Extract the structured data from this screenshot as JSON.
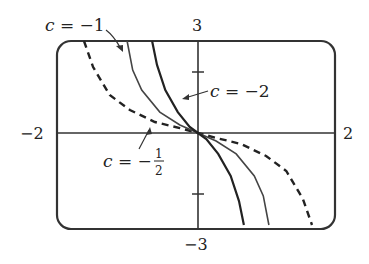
{
  "chart_data": {
    "type": "line",
    "title": "",
    "xlabel": "",
    "ylabel": "",
    "xlim": [
      -2,
      2
    ],
    "ylim": [
      -3,
      3
    ],
    "grid": false,
    "axis_labels": {
      "x_min": "−2",
      "x_max": "2",
      "y_min": "−3",
      "y_max": "3"
    },
    "yticks": [
      2,
      -2
    ],
    "series": [
      {
        "name": "c = −1/2",
        "style": "dashed",
        "x": [
          -1.64,
          -1.51,
          -1.27,
          -0.98,
          -0.62,
          -0.26,
          0,
          0.26,
          0.62,
          0.98,
          1.27,
          1.51,
          1.64
        ],
        "y": [
          3.0,
          2.15,
          1.24,
          0.75,
          0.36,
          0.16,
          0,
          -0.16,
          -0.36,
          -0.75,
          -1.24,
          -2.15,
          -3.0
        ]
      },
      {
        "name": "c = −1",
        "style": "solid",
        "x": [
          -1.02,
          -0.94,
          -0.81,
          -0.55,
          -0.26,
          0,
          0.26,
          0.55,
          0.81,
          0.94,
          1.02
        ],
        "y": [
          3.0,
          2.05,
          1.4,
          0.68,
          0.26,
          0,
          -0.26,
          -0.68,
          -1.4,
          -2.05,
          -3.0
        ]
      },
      {
        "name": "c = −2",
        "style": "solid-bold",
        "x": [
          -0.66,
          -0.59,
          -0.47,
          -0.29,
          -0.12,
          0,
          0.12,
          0.29,
          0.47,
          0.59,
          0.66
        ],
        "y": [
          3.0,
          2.22,
          1.4,
          0.68,
          0.2,
          0,
          -0.2,
          -0.68,
          -1.4,
          -2.22,
          -3.0
        ]
      }
    ],
    "annotations": [
      {
        "text": "c = −1",
        "points_to": "c = -1 curve"
      },
      {
        "text": "c = −2",
        "points_to": "c = -2 curve"
      },
      {
        "text": "c = −1/2",
        "points_to": "c = -1/2 curve"
      }
    ]
  },
  "labels": {
    "c_minus_1": {
      "var": "c",
      "eq": " = −1"
    },
    "c_minus_2": {
      "var": "c",
      "eq": " = −2"
    },
    "c_minus_half": {
      "var": "c",
      "eq": " = −",
      "num": "1",
      "den": "2"
    },
    "x_min": "−2",
    "x_max": "2",
    "y_max": "3",
    "y_min": "−3"
  }
}
